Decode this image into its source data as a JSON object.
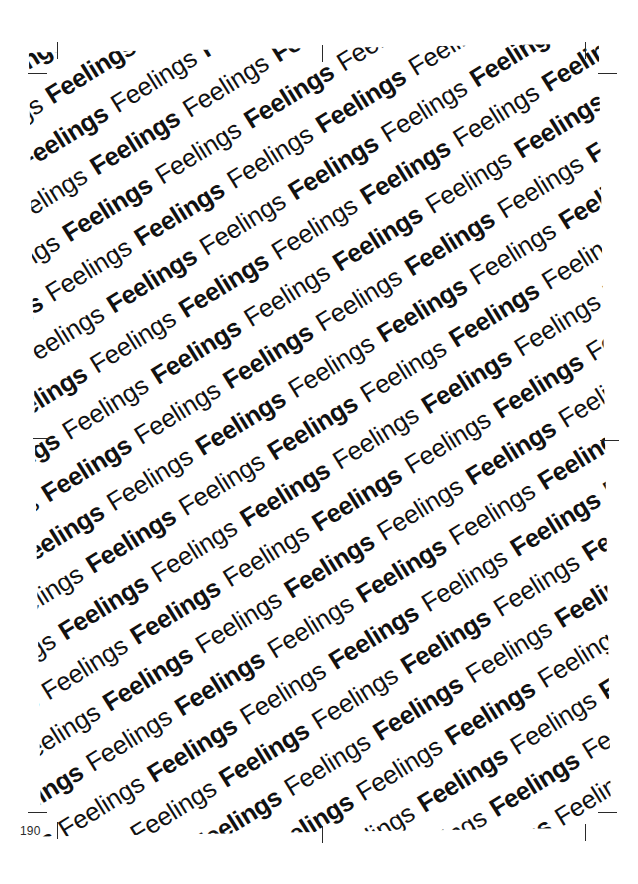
{
  "page": {
    "folio": "190",
    "background_color": "#ffffff",
    "ink_color": "#111111"
  },
  "artwork": {
    "repeated_word": "Feelings",
    "weights": [
      "bold",
      "regular"
    ],
    "rotation_degrees": -31,
    "rows": 40,
    "words_per_row": 26,
    "block": {
      "left": 35,
      "top": 48,
      "width": 570,
      "height": 784
    }
  },
  "crop_marks": [
    {
      "name": "crop-mark-top-left-vertical",
      "type": "v",
      "x": 57,
      "y": 42
    },
    {
      "name": "crop-mark-top-left-horizontal",
      "type": "h",
      "x": 28,
      "y": 73
    },
    {
      "name": "crop-mark-top-center",
      "type": "v",
      "x": 322,
      "y": 45
    },
    {
      "name": "crop-mark-top-right-vertical",
      "type": "v",
      "x": 585,
      "y": 42
    },
    {
      "name": "crop-mark-top-right-horizontal",
      "type": "h",
      "x": 598,
      "y": 73
    },
    {
      "name": "crop-mark-mid-left",
      "type": "h",
      "x": 33,
      "y": 438
    },
    {
      "name": "crop-mark-mid-right",
      "type": "h",
      "x": 600,
      "y": 440
    },
    {
      "name": "crop-mark-bottom-left-horizontal",
      "type": "h",
      "x": 28,
      "y": 812
    },
    {
      "name": "crop-mark-bottom-left-vertical",
      "type": "v",
      "x": 57,
      "y": 822
    },
    {
      "name": "crop-mark-bottom-center",
      "type": "v",
      "x": 322,
      "y": 826
    },
    {
      "name": "crop-mark-bottom-right-vertical",
      "type": "v",
      "x": 585,
      "y": 824
    },
    {
      "name": "crop-mark-bottom-right-horizontal",
      "type": "h",
      "x": 598,
      "y": 812
    }
  ]
}
